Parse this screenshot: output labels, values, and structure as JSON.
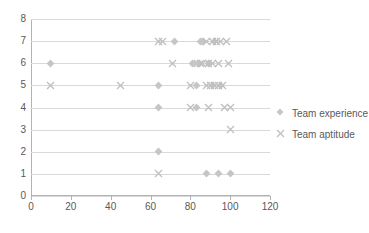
{
  "chart_data": {
    "type": "scatter",
    "title": "",
    "xlabel": "",
    "ylabel": "",
    "xlim": [
      0,
      120
    ],
    "ylim": [
      0,
      8
    ],
    "xticks": [
      "0",
      "20",
      "40",
      "60",
      "80",
      "100",
      "120"
    ],
    "yticks": [
      "0",
      "1",
      "2",
      "3",
      "4",
      "5",
      "6",
      "7",
      "8"
    ],
    "grid": "horizontal",
    "legend_position": "right",
    "colors": {
      "team_experience": "#c6c6c6",
      "team_aptitude": "#bfbfbf",
      "gridline": "#d9d9d9",
      "axis": "#b3b3b3",
      "text": "#595959"
    },
    "series": [
      {
        "name": "Team experience",
        "marker": "diamond",
        "color": "#c6c6c6",
        "points": [
          [
            10,
            6
          ],
          [
            64,
            5
          ],
          [
            64,
            4
          ],
          [
            64,
            2
          ],
          [
            72,
            7
          ],
          [
            81,
            6
          ],
          [
            82,
            6
          ],
          [
            83,
            5
          ],
          [
            83,
            4
          ],
          [
            84,
            6
          ],
          [
            85,
            7
          ],
          [
            86,
            7
          ],
          [
            88,
            1
          ],
          [
            89,
            6
          ],
          [
            91,
            5
          ],
          [
            92,
            7
          ],
          [
            94,
            1
          ],
          [
            95,
            5
          ],
          [
            100,
            1
          ]
        ]
      },
      {
        "name": "Team aptitude",
        "marker": "cross",
        "color": "#bfbfbf",
        "points": [
          [
            10,
            5
          ],
          [
            45,
            5
          ],
          [
            64,
            7
          ],
          [
            64,
            1
          ],
          [
            66,
            7
          ],
          [
            71,
            6
          ],
          [
            80,
            5
          ],
          [
            80,
            4
          ],
          [
            85,
            6
          ],
          [
            86,
            6
          ],
          [
            88,
            7
          ],
          [
            88,
            5
          ],
          [
            89,
            6
          ],
          [
            89,
            4
          ],
          [
            90,
            5
          ],
          [
            91,
            7
          ],
          [
            91,
            6
          ],
          [
            92,
            5
          ],
          [
            93,
            7
          ],
          [
            94,
            6
          ],
          [
            94,
            5
          ],
          [
            95,
            7
          ],
          [
            96,
            5
          ],
          [
            97,
            4
          ],
          [
            98,
            7
          ],
          [
            99,
            6
          ],
          [
            100,
            4
          ],
          [
            100,
            3
          ]
        ]
      }
    ]
  }
}
